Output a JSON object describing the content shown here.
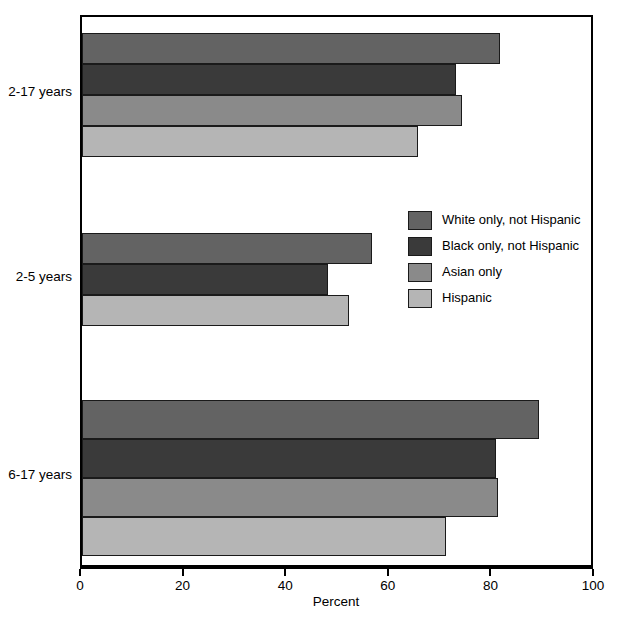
{
  "chart_data": {
    "type": "bar",
    "orientation": "horizontal",
    "title": "",
    "xlabel": "Percent",
    "ylabel": "",
    "xlim": [
      0,
      100
    ],
    "xticks": [
      0,
      20,
      40,
      60,
      80,
      100
    ],
    "xtick_labels": [
      "0",
      "20",
      "40",
      "60",
      "80",
      "100"
    ],
    "grid": false,
    "legend_position": "center-right",
    "categories": [
      "2-17 years",
      "2-5 years",
      "6-17 years"
    ],
    "series": [
      {
        "name": "White only, not Hispanic",
        "color": "#636363",
        "values": [
          81.5,
          56.5,
          89.0
        ]
      },
      {
        "name": "Black only, not Hispanic",
        "color": "#3a3a3a",
        "values": [
          73.0,
          48.0,
          80.7
        ]
      },
      {
        "name": "Asian only",
        "color": "#8a8a8a",
        "values": [
          74.0,
          null,
          81.0
        ]
      },
      {
        "name": "Hispanic",
        "color": "#b5b5b5",
        "values": [
          65.5,
          52.0,
          71.0
        ]
      }
    ]
  },
  "axis": {
    "x_title": "Percent",
    "tick_0": "0",
    "tick_20": "20",
    "tick_40": "40",
    "tick_60": "60",
    "tick_80": "80",
    "tick_100": "100"
  },
  "category_labels": {
    "group_0": "2-17 years",
    "group_1": "2-5 years",
    "group_2": "6-17 years"
  },
  "legend": {
    "items": [
      {
        "label": "White only, not Hispanic",
        "color": "#636363"
      },
      {
        "label": "Black only, not Hispanic",
        "color": "#3a3a3a"
      },
      {
        "label": "Asian only",
        "color": "#8a8a8a"
      },
      {
        "label": "Hispanic",
        "color": "#b5b5b5"
      }
    ]
  },
  "colors": {
    "frame": "#000000",
    "background": "#ffffff",
    "bar_outline": "#1a1a1a"
  }
}
